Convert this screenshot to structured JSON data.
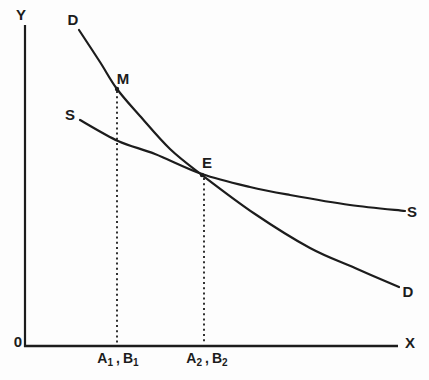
{
  "colors": {
    "ink": "#1c1c1c",
    "background": "#fdfdfd"
  },
  "labels": {
    "y_axis": "Y",
    "x_axis": "X",
    "origin": "0",
    "demand_top": "D",
    "demand_right": "D",
    "supply_left": "S",
    "supply_right": "S",
    "point_m": "M",
    "point_e": "E",
    "tick1": {
      "var1": "A",
      "sub1": "1",
      "comma": ",",
      "var2": "B",
      "sub2": "1"
    },
    "tick2": {
      "var1": "A",
      "sub1": "2",
      "comma": ",",
      "var2": "B",
      "sub2": "2"
    }
  },
  "figure": {
    "axes": {
      "y": {
        "x": 25,
        "y1": 25,
        "y2": 347
      },
      "x": {
        "y": 346,
        "x1": 24,
        "x2": 398
      }
    },
    "curves": [
      {
        "name": "demand-curve",
        "points": [
          [
            79,
            30
          ],
          [
            100,
            62
          ],
          [
            117,
            89
          ],
          [
            140,
            116
          ],
          [
            170,
            149
          ],
          [
            202,
            175
          ],
          [
            255,
            214
          ],
          [
            310,
            248
          ],
          [
            355,
            268
          ],
          [
            399,
            287
          ]
        ]
      },
      {
        "name": "supply-curve",
        "points": [
          [
            80,
            120
          ],
          [
            118,
            141
          ],
          [
            155,
            154
          ],
          [
            202,
            174
          ],
          [
            250,
            187
          ],
          [
            290,
            195
          ],
          [
            350,
            205
          ],
          [
            405,
            211
          ]
        ]
      }
    ],
    "dashed_lines": [
      {
        "name": "dashed-line-a1b1",
        "x": 117,
        "y1": 91,
        "y2": 344
      },
      {
        "name": "dashed-line-a2b2",
        "x": 204,
        "y1": 178,
        "y2": 344
      }
    ],
    "points": [
      {
        "name": "point-m-marker",
        "x": 117,
        "y": 89
      },
      {
        "name": "point-e-marker",
        "x": 202,
        "y": 175
      }
    ]
  }
}
